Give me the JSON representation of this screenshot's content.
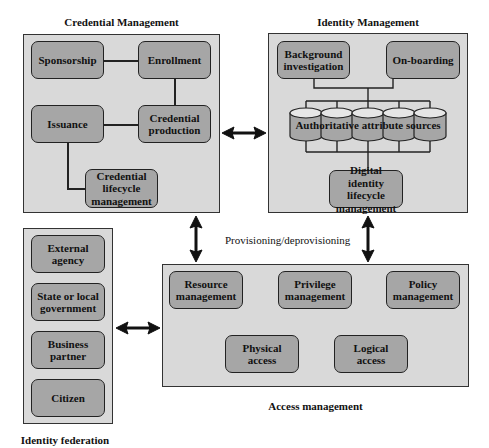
{
  "credential_management": {
    "title": "Credential Management",
    "sponsorship": "Sponsorship",
    "enrollment": "Enrollment",
    "issuance": "Issuance",
    "credential_production": "Credential production",
    "credential_lifecycle": "Credential lifecycle management"
  },
  "identity_management": {
    "title": "Identity Management",
    "background_investigation": "Background investigation",
    "onboarding": "On-boarding",
    "authoritative_sources": "Authoritative attribute sources",
    "digital_identity_lifecycle": "Digital identity lifecycle management"
  },
  "provisioning_label": "Provisioning/deprovisioning",
  "access_management": {
    "title": "Access management",
    "resource": "Resource management",
    "privilege": "Privilege management",
    "policy": "Policy management",
    "physical": "Physical access",
    "logical": "Logical access"
  },
  "identity_federation": {
    "title": "Identity federation",
    "items": [
      "External agency",
      "State or local government",
      "Business partner",
      "Citizen"
    ]
  },
  "colors": {
    "panel_fill": "#d9d9d9",
    "box_fill": "#a6a6a6",
    "cylinder_fill": "#a6a6a6",
    "cylinder_top": "#e6e6e6",
    "stroke": "#222222"
  }
}
